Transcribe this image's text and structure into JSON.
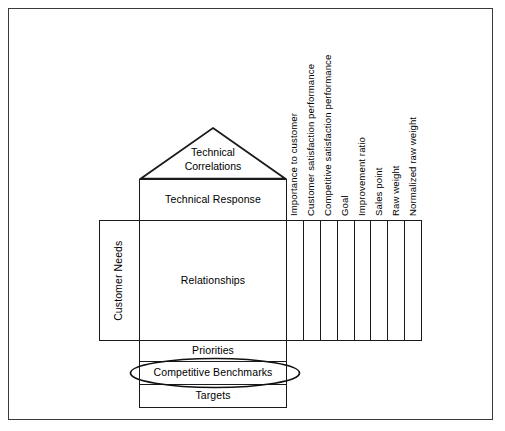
{
  "diagram": {
    "type": "qfd-house-of-quality",
    "frame": {
      "border_color": "#3a3a3a",
      "background": "#ffffff"
    },
    "line_color": "#1a1a1a",
    "roof": {
      "label": "Technical\nCorrelations",
      "shape": "triangle"
    },
    "technical_response": {
      "label": "Technical Response"
    },
    "customer_needs": {
      "label": "Customer Needs",
      "orientation": "vertical"
    },
    "relationships": {
      "label": "Relationships"
    },
    "planning_matrix": {
      "column_count": 8,
      "headers": [
        "Importance to customer",
        "Customer satisfaction performance",
        "Competitive satisfaction performance",
        "Goal",
        "Improvement ratio",
        "Sales point",
        "Raw weight",
        "Normalized raw weight"
      ]
    },
    "bottom_rows": [
      {
        "name": "priorities",
        "label": "Priorities"
      },
      {
        "name": "competitive-benchmarks",
        "label": "Competitive Benchmarks"
      },
      {
        "name": "targets",
        "label": "Targets"
      }
    ],
    "highlight": {
      "name": "benchmark-ellipse",
      "shape": "ellipse",
      "targets": "Competitive Benchmarks"
    }
  }
}
